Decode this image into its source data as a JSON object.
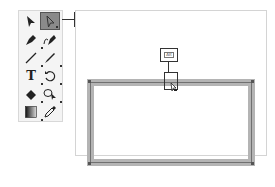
{
  "toolbar": {
    "tools": [
      {
        "name": "selection-tool",
        "icon": "black-arrow-icon"
      },
      {
        "name": "direct-selection-tool",
        "icon": "white-arrow-icon",
        "selected": true
      },
      {
        "name": "pen-tool",
        "icon": "pen-icon"
      },
      {
        "name": "curvature-tool",
        "icon": "curvature-pen-icon"
      },
      {
        "name": "line-tool",
        "icon": "line-icon"
      },
      {
        "name": "paintbrush-tool",
        "icon": "brush-icon"
      },
      {
        "name": "type-tool",
        "icon": "type-icon",
        "glyph": "T"
      },
      {
        "name": "rotate-tool",
        "icon": "rotate-icon"
      },
      {
        "name": "eraser-tool",
        "icon": "eraser-icon"
      },
      {
        "name": "shape-builder-tool",
        "icon": "shape-builder-icon"
      },
      {
        "name": "gradient-tool",
        "icon": "gradient-icon"
      },
      {
        "name": "eyedropper-tool",
        "icon": "eyedropper-icon"
      }
    ]
  },
  "callouts": {
    "tool_label": "선택",
    "key_label": "Alt"
  },
  "colors": {
    "frame_stroke": "#b4b4b4",
    "selected_tool_bg": "#8a8a8a"
  }
}
